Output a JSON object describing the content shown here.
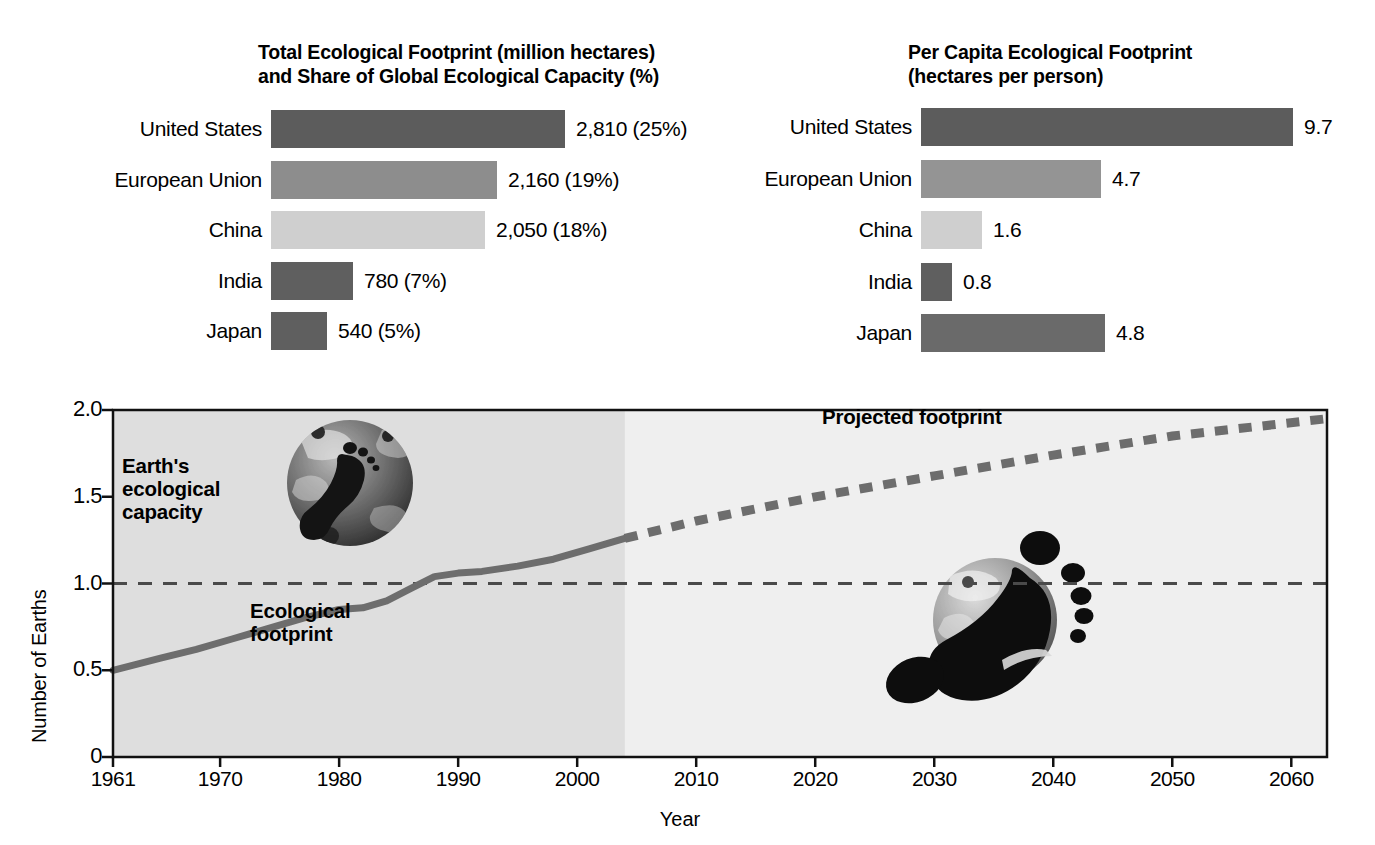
{
  "figure": {
    "background": "#ffffff",
    "panels": {
      "total": {
        "title": "Total Ecological Footprint (million hectares)\nand Share of Global Ecological Capacity (%)",
        "labels": [
          "United States",
          "European Union",
          "China",
          "India",
          "Japan"
        ],
        "values": [
          2810,
          2160,
          2050,
          780,
          540
        ],
        "shares": [
          25,
          19,
          18,
          7,
          5
        ],
        "value_labels": [
          "2,810 (25%)",
          "2,160 (19%)",
          "2,050 (18%)",
          "780 (7%)",
          "540 (5%)"
        ],
        "bar_colors": [
          "#5c5c5c",
          "#8d8d8d",
          "#cfcfcf",
          "#5f5f5f",
          "#5f5f5f"
        ]
      },
      "per_capita": {
        "title": "Per Capita Ecological Footprint\n(hectares per person)",
        "labels": [
          "United States",
          "European Union",
          "China",
          "India",
          "Japan"
        ],
        "values": [
          9.7,
          4.7,
          1.6,
          0.8,
          4.8
        ],
        "value_labels": [
          "9.7",
          "4.7",
          "1.6",
          "0.8",
          "4.8"
        ],
        "bar_colors": [
          "#5c5c5c",
          "#949494",
          "#cfcfcf",
          "#5f5f5f",
          "#6a6a6a"
        ]
      }
    },
    "line_chart": {
      "ylabel": "Number of Earths",
      "xlabel": "Year",
      "ytick_labels": [
        "2.0",
        "1.5",
        "1.0",
        "0.5",
        "0"
      ],
      "ytick_values": [
        2.0,
        1.5,
        1.0,
        0.5,
        0
      ],
      "xtick_labels": [
        "1961",
        "1970",
        "1980",
        "1990",
        "2000",
        "2010",
        "2020",
        "2030",
        "2040",
        "2050",
        "2060"
      ],
      "xtick_values": [
        1961,
        1970,
        1980,
        1990,
        2000,
        2010,
        2020,
        2030,
        2040,
        2050,
        2060
      ],
      "annotations": {
        "capacity": "Earth's\necological\ncapacity",
        "footprint": "Ecological\nfootprint",
        "projected": "Projected footprint"
      },
      "capacity_line_value": 1.0,
      "historic_shade_end_year": 2004,
      "line_color": "#6d6d6d",
      "shade_color": "#dedede",
      "plot_bg_color": "#efefef"
    }
  },
  "chart_data": [
    {
      "type": "bar",
      "orientation": "horizontal",
      "title": "Total Ecological Footprint (million hectares) and Share of Global Ecological Capacity (%)",
      "xlabel": "",
      "ylabel": "",
      "categories": [
        "United States",
        "European Union",
        "China",
        "India",
        "Japan"
      ],
      "values": [
        2810,
        2160,
        2050,
        780,
        540
      ],
      "data_labels": [
        "2,810 (25%)",
        "2,160 (19%)",
        "2,050 (18%)",
        "780 (7%)",
        "540 (5%)"
      ],
      "units": "million hectares",
      "share_percent": [
        25,
        19,
        18,
        7,
        5
      ],
      "xlim": [
        0,
        2810
      ],
      "grid": false,
      "legend": "none"
    },
    {
      "type": "bar",
      "orientation": "horizontal",
      "title": "Per Capita Ecological Footprint (hectares per person)",
      "xlabel": "",
      "ylabel": "",
      "categories": [
        "United States",
        "European Union",
        "China",
        "India",
        "Japan"
      ],
      "values": [
        9.7,
        4.7,
        1.6,
        0.8,
        4.8
      ],
      "data_labels": [
        "9.7",
        "4.7",
        "1.6",
        "0.8",
        "4.8"
      ],
      "units": "hectares per person",
      "xlim": [
        0,
        9.7
      ],
      "grid": false,
      "legend": "none"
    },
    {
      "type": "line",
      "title": "",
      "xlabel": "Year",
      "ylabel": "Number of Earths",
      "xlim": [
        1961,
        2063
      ],
      "ylim": [
        0,
        2.0
      ],
      "yticks": [
        0,
        0.5,
        1.0,
        1.5,
        2.0
      ],
      "xticks": [
        1961,
        1970,
        1980,
        1990,
        2000,
        2010,
        2020,
        2030,
        2040,
        2050,
        2060
      ],
      "grid": false,
      "legend": "none",
      "annotations": [
        "Earth's ecological capacity",
        "Ecological footprint",
        "Projected footprint"
      ],
      "series": [
        {
          "name": "Ecological footprint",
          "style": "solid",
          "x": [
            1961,
            1965,
            1968,
            1971,
            1974,
            1977,
            1980,
            1982,
            1984,
            1986,
            1988,
            1990,
            1992,
            1995,
            1998,
            2001,
            2004
          ],
          "values": [
            0.5,
            0.57,
            0.62,
            0.68,
            0.74,
            0.8,
            0.85,
            0.86,
            0.9,
            0.97,
            1.04,
            1.06,
            1.07,
            1.1,
            1.14,
            1.2,
            1.26
          ]
        },
        {
          "name": "Projected footprint",
          "style": "dashed",
          "x": [
            2004,
            2010,
            2020,
            2030,
            2040,
            2050,
            2063
          ],
          "values": [
            1.26,
            1.36,
            1.5,
            1.62,
            1.74,
            1.85,
            1.95
          ]
        },
        {
          "name": "Earth's ecological capacity",
          "style": "dashed-reference",
          "x": [
            1961,
            2063
          ],
          "values": [
            1.0,
            1.0
          ]
        }
      ]
    }
  ]
}
